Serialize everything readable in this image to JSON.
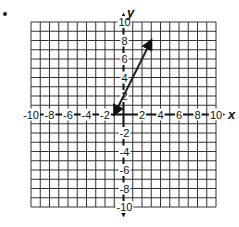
{
  "chart_data": {
    "type": "line",
    "title": "",
    "xlabel": "x",
    "ylabel": "y",
    "xlim": [
      -10,
      10
    ],
    "ylim": [
      -10,
      10
    ],
    "grid": true,
    "grid_step": 1,
    "x_tick_labels": [
      "-10",
      "-8",
      "-6",
      "-4",
      "-2",
      "2",
      "4",
      "6",
      "8",
      "10"
    ],
    "y_tick_labels": [
      "10",
      "8",
      "6",
      "4",
      "2",
      "-2",
      "-4",
      "-6",
      "-8",
      "-10"
    ],
    "series": [
      {
        "name": "line",
        "equation": "y = 2x + 2",
        "arrows_both_ends": true,
        "points": [
          [
            -1,
            0
          ],
          [
            3,
            8
          ]
        ],
        "color": "#222222"
      }
    ],
    "legend": null
  },
  "labels": {
    "x_axis": "x",
    "y_axis": "y"
  },
  "colors": {
    "grid": "#333333",
    "axis": "#111111",
    "line": "#222222",
    "background": "#ffffff"
  }
}
